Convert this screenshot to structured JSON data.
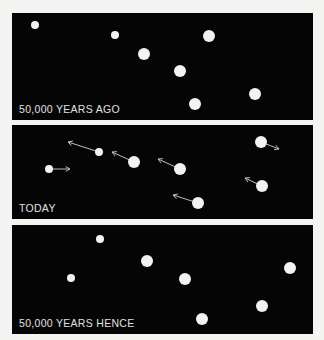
{
  "panels": [
    {
      "id": "past",
      "label": "50,000 YEARS AGO",
      "top": 13,
      "height": 107,
      "stars": [
        {
          "x": 35,
          "y": 25,
          "r": 4
        },
        {
          "x": 115,
          "y": 35,
          "r": 4
        },
        {
          "x": 209,
          "y": 36,
          "r": 6
        },
        {
          "x": 144,
          "y": 54,
          "r": 6
        },
        {
          "x": 180,
          "y": 71,
          "r": 6
        },
        {
          "x": 255,
          "y": 94,
          "r": 6
        },
        {
          "x": 195,
          "y": 104,
          "r": 6
        }
      ]
    },
    {
      "id": "today",
      "label": "TODAY",
      "top": 125,
      "height": 94,
      "stars": [
        {
          "x": 49,
          "y": 169,
          "r": 4,
          "ax": 70,
          "ay": 169
        },
        {
          "x": 99,
          "y": 152,
          "r": 4,
          "ax": 68,
          "ay": 142
        },
        {
          "x": 134,
          "y": 162,
          "r": 6,
          "ax": 112,
          "ay": 152
        },
        {
          "x": 180,
          "y": 169,
          "r": 6,
          "ax": 158,
          "ay": 159
        },
        {
          "x": 198,
          "y": 203,
          "r": 6,
          "ax": 173,
          "ay": 195
        },
        {
          "x": 261,
          "y": 142,
          "r": 6,
          "ax": 279,
          "ay": 149
        },
        {
          "x": 262,
          "y": 186,
          "r": 6,
          "ax": 245,
          "ay": 178
        }
      ]
    },
    {
      "id": "future",
      "label": "50,000 YEARS HENCE",
      "top": 225,
      "height": 109,
      "stars": [
        {
          "x": 100,
          "y": 239,
          "r": 4
        },
        {
          "x": 71,
          "y": 278,
          "r": 4
        },
        {
          "x": 147,
          "y": 261,
          "r": 6
        },
        {
          "x": 185,
          "y": 279,
          "r": 6
        },
        {
          "x": 290,
          "y": 268,
          "r": 6
        },
        {
          "x": 262,
          "y": 306,
          "r": 6
        },
        {
          "x": 202,
          "y": 319,
          "r": 6
        }
      ]
    }
  ],
  "colors": {
    "background": "#f4f4f2",
    "panel": "#050505",
    "star": "#f2f2f2",
    "arrow": "#bdbdbd",
    "label": "#e0e0e0"
  }
}
